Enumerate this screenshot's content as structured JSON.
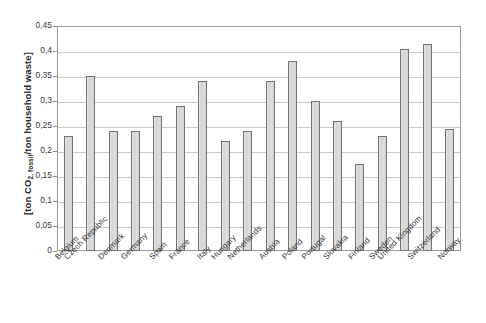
{
  "chart_data": {
    "type": "bar",
    "title": "",
    "subtitle": "",
    "xlabel": "",
    "ylabel": "[ton CO2,fossil/ton household waste]",
    "ylabel_prefix": "[ton CO",
    "ylabel_sub": "2, fossil",
    "ylabel_suffix": "/ton household waste]",
    "ylim": [
      0,
      0.45
    ],
    "ytick_labels": [
      "0,45",
      "0,4",
      "0,35",
      "0,3",
      "0,25",
      "0,2",
      "0,15",
      "0,1",
      "0,05",
      "0"
    ],
    "ytick_values": [
      0.45,
      0.4,
      0.35,
      0.3,
      0.25,
      0.2,
      0.15,
      0.1,
      0.05,
      0
    ],
    "grid": true,
    "legend": "none",
    "categories": [
      "Belgium",
      "Czech Republic",
      "Denmark",
      "Germany",
      "Spain",
      "France",
      "Italy",
      "Hungary",
      "Netherlands",
      "Austria",
      "Poland",
      "Portugal",
      "Slovakia",
      "Finland",
      "Sweden",
      "United Kingdom",
      "Switzerland",
      "Norway"
    ],
    "values": [
      0.23,
      0.35,
      0.24,
      0.24,
      0.27,
      0.29,
      0.34,
      0.22,
      0.24,
      0.34,
      0.38,
      0.3,
      0.26,
      0.175,
      0.23,
      0.405,
      0.415,
      0.245
    ],
    "colors": {
      "bar_fill": "#d8d8d8",
      "bar_border": "#737373",
      "grid": "#c9c9c9",
      "frame": "#9a9a9a",
      "text": "#333333",
      "background": "#ffffff"
    }
  }
}
